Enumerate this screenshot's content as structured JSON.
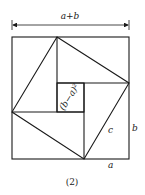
{
  "figure": {
    "caption": "(2)",
    "labels": {
      "top_dimension": "a+b",
      "inner_square": "(b−a)²",
      "hypotenuse": "c",
      "side_b": "b",
      "side_a": "a"
    },
    "geometry": {
      "outer_square": {
        "x": 12,
        "y": 37,
        "w": 117,
        "h": 122
      },
      "inner_square": {
        "x": 57,
        "y": 83,
        "w": 27,
        "h": 29
      },
      "tilted_square": [
        [
          57,
          37
        ],
        [
          129,
          83
        ],
        [
          84,
          159
        ],
        [
          12,
          112
        ]
      ]
    },
    "stroke_color": "#1a1a1a"
  }
}
